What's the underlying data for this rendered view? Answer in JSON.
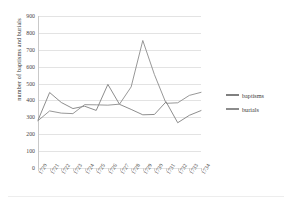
{
  "chart_data": {
    "type": "line",
    "title": "",
    "xlabel": "",
    "ylabel": "number of baptisms and burials",
    "categories": [
      "1720",
      "1721",
      "1722",
      "1723",
      "1724",
      "1725",
      "1726",
      "1727",
      "1728",
      "1729",
      "1730",
      "1731",
      "1732",
      "1733",
      "1734"
    ],
    "ylim": [
      0,
      900
    ],
    "ytick_step": 100,
    "yticks": [
      "0",
      "100",
      "200",
      "300",
      "400",
      "500",
      "600",
      "700",
      "800",
      "900"
    ],
    "grid": true,
    "legend_position": "right",
    "series": [
      {
        "name": "baptisms",
        "color": "#808080",
        "values": [
          283,
          447,
          388,
          352,
          366,
          341,
          495,
          377,
          347,
          315,
          317,
          392,
          268,
          312,
          340
        ]
      },
      {
        "name": "burials",
        "color": "#8c8c8c",
        "values": [
          280,
          338,
          325,
          322,
          375,
          374,
          372,
          378,
          480,
          755,
          553,
          383,
          386,
          430,
          448
        ]
      }
    ]
  },
  "legend": {
    "items": [
      {
        "label": "baptisms"
      },
      {
        "label": "burials"
      }
    ]
  }
}
